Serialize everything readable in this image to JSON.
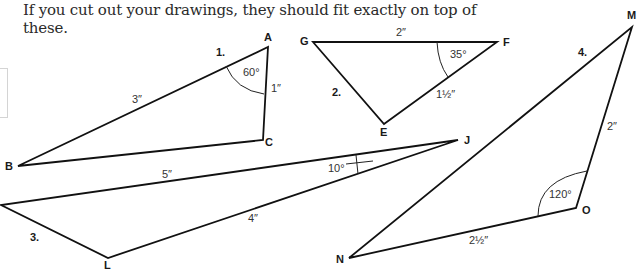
{
  "instructions": {
    "line1": "If you cut out your drawings, they should fit exactly on top of",
    "line2": "these."
  },
  "triangles": [
    {
      "number": "1.",
      "vertices": [
        {
          "label": "A",
          "x": 268,
          "y": 47
        },
        {
          "label": "C",
          "x": 263,
          "y": 140
        },
        {
          "label": "B",
          "x": 18,
          "y": 166
        }
      ],
      "measures": [
        {
          "text": "60°",
          "kind": "angle",
          "at": "A"
        },
        {
          "text": "1″",
          "kind": "side",
          "side": "AC"
        },
        {
          "text": "3″",
          "kind": "side",
          "side": "AB"
        }
      ]
    },
    {
      "number": "2.",
      "vertices": [
        {
          "label": "G",
          "x": 313,
          "y": 42
        },
        {
          "label": "F",
          "x": 497,
          "y": 42
        },
        {
          "label": "E",
          "x": 384,
          "y": 124
        }
      ],
      "measures": [
        {
          "text": "2″",
          "kind": "side",
          "side": "GF"
        },
        {
          "text": "35°",
          "kind": "angle",
          "at": "F"
        },
        {
          "text": "1½″",
          "kind": "side",
          "side": "EF"
        }
      ]
    },
    {
      "number": "3.",
      "vertices": [
        {
          "label": "J",
          "x": 458,
          "y": 140
        },
        {
          "label": "",
          "x": 1,
          "y": 205
        },
        {
          "label": "L",
          "x": 108,
          "y": 258
        }
      ],
      "measures": [
        {
          "text": "5″",
          "kind": "side",
          "side": "J-left"
        },
        {
          "text": "10°",
          "kind": "angle",
          "at": "J"
        },
        {
          "text": "4″",
          "kind": "side",
          "side": "JL"
        }
      ]
    },
    {
      "number": "4.",
      "vertices": [
        {
          "label": "M",
          "x": 632,
          "y": 27
        },
        {
          "label": "O",
          "x": 576,
          "y": 208
        },
        {
          "label": "N",
          "x": 349,
          "y": 258
        }
      ],
      "measures": [
        {
          "text": "2″",
          "kind": "side",
          "side": "MO"
        },
        {
          "text": "120°",
          "kind": "angle",
          "at": "O"
        },
        {
          "text": "2½″",
          "kind": "side",
          "side": "NO"
        }
      ]
    }
  ]
}
